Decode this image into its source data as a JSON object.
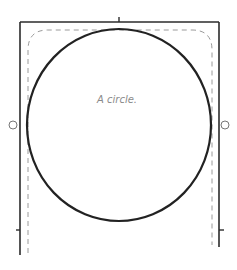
{
  "diagram": {
    "shape_type": "ellipse",
    "label": "A circle.",
    "colors": {
      "frame": "#2b2b2b",
      "shape_outline": "#222222",
      "dashed_bounds": "#9a9a9a",
      "label": "#8a8a8a",
      "handle": "#777777"
    },
    "handles": [
      "left-resize-handle",
      "right-resize-handle"
    ]
  }
}
